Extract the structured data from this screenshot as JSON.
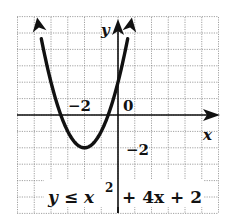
{
  "chart_data": {
    "type": "line",
    "title": "",
    "inequality": "y ≤ x² + 4x + 2",
    "function": "x^2 + 4x + 2",
    "inequality_sign": "≤",
    "boundary_style": "solid",
    "vertex": [
      -2,
      -2
    ],
    "xlabel": "x",
    "ylabel": "y",
    "xlim": [
      -6,
      6
    ],
    "ylim": [
      -6,
      6
    ],
    "grid": true,
    "tick_labels": [
      {
        "axis": "x",
        "value": -2,
        "text": "−2"
      },
      {
        "axis": "y",
        "value": -2,
        "text": "−2"
      },
      {
        "axis": "origin",
        "value": 0,
        "text": "0"
      }
    ],
    "x": [
      -4.83,
      -4,
      -3,
      -2,
      -1,
      0,
      0.83
    ],
    "values": [
      6,
      2,
      -1,
      -2,
      -1,
      2,
      6
    ]
  },
  "labels": {
    "x_axis": "x",
    "y_axis": "y",
    "origin": "0",
    "x_tick": "−2",
    "y_tick": "−2",
    "equation_y": "y",
    "equation_le": "≤",
    "equation_x": "x",
    "equation_exp": "2",
    "equation_rest": "+ 4x + 2"
  },
  "colors": {
    "curve": "#111111",
    "axis": "#111111",
    "grid": "#8a8a8a",
    "background": "#ffffff"
  }
}
